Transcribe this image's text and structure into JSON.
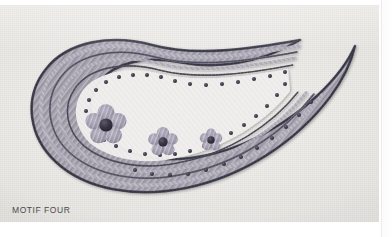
{
  "page": {
    "caption": "MOTIF FOUR",
    "background_color": "#ffffff"
  },
  "photo": {
    "subject": "embroidered paisley motif on fabric",
    "fabric_color": "#efeeec",
    "alt_text": "Hand-embroidered paisley motif worked in grey and lavender threads on off-white linen, with three five-petalled flowers inside and a border of French knots."
  },
  "motif": {
    "name": "paisley",
    "bands": [
      {
        "name": "outer-chain-stitch",
        "color": "#4a4a58",
        "width": 2.4
      },
      {
        "name": "outer-filler-band",
        "color": "#9a98a6",
        "width": 4.5
      },
      {
        "name": "middle-chain-stitch",
        "color": "#6f6d7e",
        "width": 2.0
      },
      {
        "name": "inner-filler-band",
        "color": "#a9a6b2",
        "width": 4.0
      },
      {
        "name": "inner-chain-stitch",
        "color": "#5e5c6b",
        "width": 1.8
      }
    ],
    "french_knots": {
      "name": "french-knot-dots",
      "color": "#3d3b4a",
      "count": 46,
      "radius": 1.9
    },
    "flowers": [
      {
        "name": "flower-large",
        "cx": 106,
        "cy": 120,
        "petal_radius": 17.5,
        "center_radius": 6.5,
        "petals": 5,
        "petal_color": "#a9a3b4",
        "center_color": "#35323f"
      },
      {
        "name": "flower-medium",
        "cx": 163,
        "cy": 137,
        "petal_radius": 12.5,
        "center_radius": 4.6,
        "petals": 5,
        "petal_color": "#a9a3b4",
        "center_color": "#35323f"
      },
      {
        "name": "flower-small",
        "cx": 211,
        "cy": 135,
        "petal_radius": 9.5,
        "center_radius": 3.6,
        "petals": 5,
        "petal_color": "#a9a3b4",
        "center_color": "#35323f"
      }
    ]
  }
}
